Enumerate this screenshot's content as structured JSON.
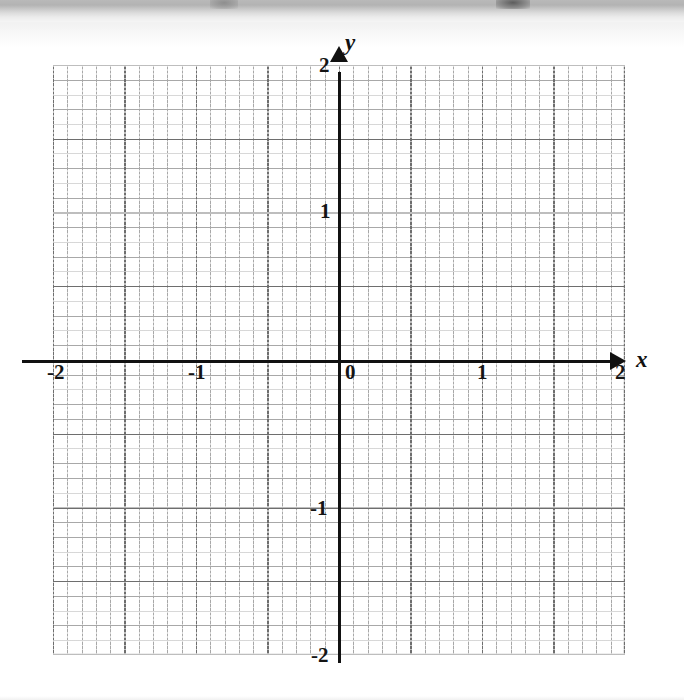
{
  "figure": {
    "kind": "coordinate-grid"
  },
  "axes": {
    "x_name": "x",
    "y_name": "y",
    "origin_label": "0"
  },
  "ticks": {
    "x": [
      {
        "value": -2,
        "label": "-2"
      },
      {
        "value": -1,
        "label": "-1"
      },
      {
        "value": 0,
        "label": "0"
      },
      {
        "value": 1,
        "label": "1"
      },
      {
        "value": 2,
        "label": "2"
      }
    ],
    "y": [
      {
        "value": 2,
        "label": "2"
      },
      {
        "value": 1,
        "label": "1"
      },
      {
        "value": -1,
        "label": "-1"
      },
      {
        "value": -2,
        "label": "-2"
      }
    ]
  },
  "chart_data": {
    "type": "scatter",
    "title": "",
    "subtitle": "",
    "xlabel": "x",
    "ylabel": "y",
    "xlim": [
      -2,
      2
    ],
    "ylim": [
      -2,
      2
    ],
    "xticks": [
      -2,
      -1,
      0,
      1,
      2
    ],
    "yticks": [
      -2,
      -1,
      0,
      1,
      2
    ],
    "xticklabels": [
      "-2",
      "-1",
      "0",
      "1",
      "2"
    ],
    "yticklabels": [
      "-2",
      "-1",
      "0",
      "1",
      "2"
    ],
    "grid": true,
    "minor_grid": true,
    "minor_ticks_per_major": 5,
    "legend": null,
    "series": [],
    "annotations": []
  },
  "colors": {
    "axis": "#111111",
    "major_grid": "#6e6e6e",
    "minor_grid": "#a8a8a8",
    "paper": "#ffffff"
  }
}
